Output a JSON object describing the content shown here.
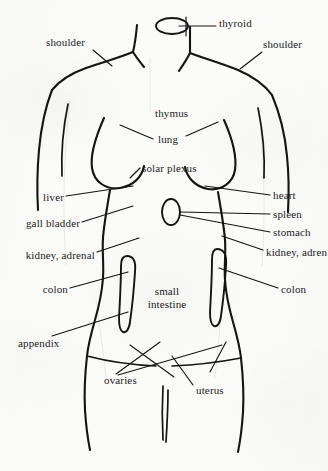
{
  "diagram": {
    "ink_color": "#141414",
    "paper_color": "#fbfbfa",
    "labels": [
      {
        "id": "thyroid",
        "text": "thyroid",
        "x": 219,
        "y": 22,
        "align": "left"
      },
      {
        "id": "shoulder-left",
        "text": "shoulder",
        "x": 46,
        "y": 42,
        "align": "left"
      },
      {
        "id": "shoulder-right",
        "text": "shoulder",
        "x": 263,
        "y": 44,
        "align": "left"
      },
      {
        "id": "thymus",
        "text": "thymus",
        "x": 155,
        "y": 113,
        "align": "center"
      },
      {
        "id": "lung",
        "text": "lung",
        "x": 160,
        "y": 139,
        "align": "center"
      },
      {
        "id": "solar-plexus",
        "text": "solar plexus",
        "x": 142,
        "y": 168,
        "align": "center"
      },
      {
        "id": "liver",
        "text": "liver",
        "x": 41,
        "y": 198,
        "align": "right"
      },
      {
        "id": "heart",
        "text": "heart",
        "x": 273,
        "y": 196,
        "align": "left"
      },
      {
        "id": "gall-bladder",
        "text": "gall bladder",
        "x": 17,
        "y": 224,
        "align": "right"
      },
      {
        "id": "spleen",
        "text": "spleen",
        "x": 273,
        "y": 215,
        "align": "left"
      },
      {
        "id": "stomach",
        "text": "stomach",
        "x": 273,
        "y": 233,
        "align": "left"
      },
      {
        "id": "kidney-adrenal-left",
        "text": "kidney, adrenal",
        "x": 9,
        "y": 256,
        "align": "right"
      },
      {
        "id": "kidney-adrenal-right",
        "text": "kidney, adren",
        "x": 266,
        "y": 253,
        "align": "left"
      },
      {
        "id": "colon-left",
        "text": "colon",
        "x": 28,
        "y": 290,
        "align": "right"
      },
      {
        "id": "colon-right",
        "text": "colon",
        "x": 281,
        "y": 290,
        "align": "left"
      },
      {
        "id": "small-intestine",
        "text": "small\nintestine",
        "x": 155,
        "y": 293,
        "align": "center"
      },
      {
        "id": "appendix",
        "text": "appendix",
        "x": 18,
        "y": 343,
        "align": "left"
      },
      {
        "id": "ovaries",
        "text": "ovaries",
        "x": 104,
        "y": 380,
        "align": "left"
      },
      {
        "id": "uterus",
        "text": "uterus",
        "x": 196,
        "y": 390,
        "align": "left"
      }
    ],
    "organs": [
      {
        "id": "thyroid-shape",
        "name": "thyroid gland",
        "shape": "ellipse"
      },
      {
        "id": "stomach-shape",
        "name": "stomach",
        "shape": "ellipse"
      },
      {
        "id": "colon-left-shape",
        "name": "ascending colon",
        "shape": "elongated-oval"
      },
      {
        "id": "colon-right-shape",
        "name": "descending colon",
        "shape": "elongated-oval"
      }
    ]
  }
}
